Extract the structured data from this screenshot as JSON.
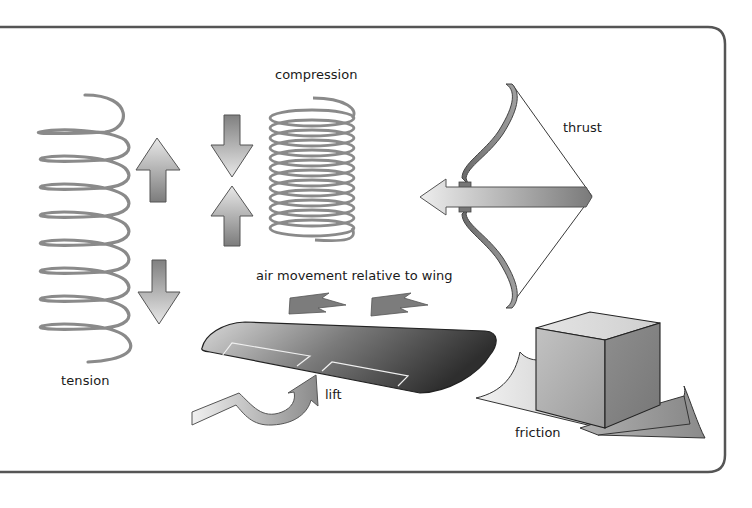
{
  "diagram": {
    "labels": {
      "tension": "tension",
      "compression": "compression",
      "thrust": "thrust",
      "air_movement": "air movement relative to wing",
      "lift": "lift",
      "friction": "friction"
    },
    "panels": [
      {
        "id": "tension",
        "depicts": "extended coil spring with arrows pointing up and down (pulling apart)"
      },
      {
        "id": "compression",
        "depicts": "compressed coil spring with arrows pointing toward each other"
      },
      {
        "id": "thrust",
        "depicts": "drawn bow with arrow pointing left"
      },
      {
        "id": "lift",
        "depicts": "aircraft wing with air-movement arrows above and a curved lift arrow below"
      },
      {
        "id": "friction",
        "depicts": "cube resting on a surface that wrinkles at its edges"
      }
    ],
    "colors": {
      "frame": "#555555",
      "spring": "#8a8a8a",
      "arrow_light": "#e6e6e6",
      "arrow_dark": "#7a7a7a",
      "wing_dark": "#3a3a3a",
      "text": "#1a1a1a"
    }
  }
}
